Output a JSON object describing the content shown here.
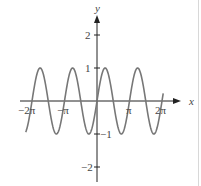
{
  "chart_data": {
    "type": "line",
    "title": "",
    "xlabel": "x",
    "ylabel": "y",
    "function": "y = sin(2x)",
    "xlim": [
      -6.9,
      6.4
    ],
    "ylim": [
      -2.5,
      2.5
    ],
    "grid": false,
    "x_tick_labels": [
      "-2π",
      "-π",
      "π",
      "2π"
    ],
    "x_tick_values": [
      -6.2832,
      -3.1416,
      3.1416,
      6.2832
    ],
    "y_tick_labels": [
      "2",
      "1",
      "-1",
      "-2"
    ],
    "y_tick_values": [
      2,
      1,
      -1,
      -2
    ],
    "series": [
      {
        "name": "sin(2x)",
        "color": "#777777",
        "x": [
          -6.9,
          -6.2832,
          -5.4978,
          -4.7124,
          -3.927,
          -3.1416,
          -2.3562,
          -1.5708,
          -0.7854,
          0,
          0.7854,
          1.5708,
          2.3562,
          3.1416,
          3.927,
          4.7124,
          5.4978,
          6.2832,
          6.4
        ],
        "values": [
          -0.94,
          0,
          1,
          0,
          -1,
          0,
          1,
          0,
          -1,
          0,
          1,
          0,
          -1,
          0,
          1,
          0,
          -1,
          0,
          0.23
        ]
      }
    ]
  },
  "axes": {
    "x_label": "x",
    "y_label": "y"
  },
  "ticks": {
    "x": [
      "−2π",
      "−π",
      "π",
      "2π"
    ],
    "y": [
      "2",
      "1",
      "−1",
      "−2"
    ]
  },
  "colors": {
    "axis": "#222222",
    "curve": "#777777",
    "text": "#444444"
  }
}
